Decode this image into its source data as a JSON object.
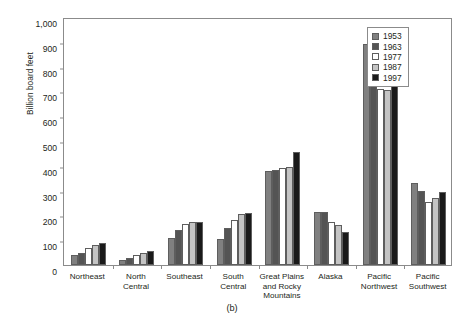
{
  "chart_data": {
    "type": "bar",
    "title": "",
    "xlabel": "",
    "ylabel": "Billion board feet",
    "ylim": [
      0,
      1000
    ],
    "yticks": [
      0,
      100,
      200,
      300,
      400,
      500,
      600,
      700,
      800,
      900,
      1000
    ],
    "ytick_labels": [
      "0",
      "100",
      "200",
      "300",
      "400",
      "500",
      "600",
      "700",
      "800",
      "900",
      "1,000"
    ],
    "grid": false,
    "legend_position": "top-right",
    "categories": [
      "Northeast",
      "North Central",
      "Southeast",
      "South Central",
      "Great Plains and Rocky Mountains",
      "Alaska",
      "Pacific Northwest",
      "Pacific Southwest"
    ],
    "category_lines": [
      [
        "Northeast"
      ],
      [
        "North",
        "Central"
      ],
      [
        "Southeast"
      ],
      [
        "South",
        "Central"
      ],
      [
        "Great Plains",
        "and Rocky",
        "Mountains"
      ],
      [
        "Alaska"
      ],
      [
        "Pacific",
        "Northwest"
      ],
      [
        "Pacific",
        "Southwest"
      ]
    ],
    "series": [
      {
        "name": "1953",
        "color": "#808080",
        "values": [
          40,
          22,
          110,
          105,
          380,
          215,
          890,
          330
        ]
      },
      {
        "name": "1963",
        "color": "#545454",
        "values": [
          50,
          30,
          140,
          150,
          385,
          215,
          830,
          300
        ]
      },
      {
        "name": "1977",
        "color": "#ffffff",
        "values": [
          70,
          42,
          165,
          180,
          390,
          175,
          710,
          255
        ]
      },
      {
        "name": "1987",
        "color": "#c4c4c4",
        "values": [
          80,
          50,
          175,
          205,
          395,
          160,
          705,
          270
        ]
      },
      {
        "name": "1997",
        "color": "#1a1a1a",
        "values": [
          88,
          55,
          175,
          210,
          455,
          135,
          790,
          295
        ]
      }
    ]
  },
  "caption": {
    "text": "(b)"
  }
}
